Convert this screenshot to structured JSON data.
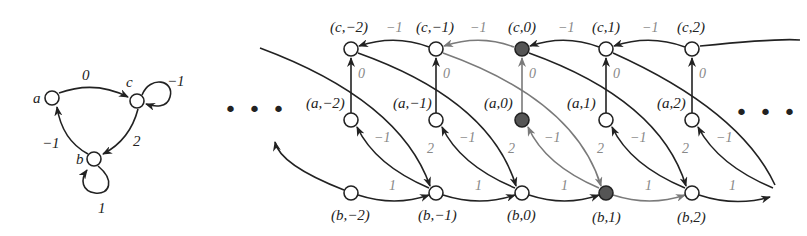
{
  "colors": {
    "edge_dark": "#222222",
    "edge_gray": "#7a7a7a",
    "node_fill_highlight": "#555555",
    "node_fill": "#ffffff",
    "text": "#222222",
    "gray_text": "#888888"
  },
  "small_graph": {
    "nodes": [
      {
        "id": "a",
        "label": "a",
        "x": 52,
        "y": 98
      },
      {
        "id": "c",
        "label": "c",
        "x": 137,
        "y": 101
      },
      {
        "id": "b",
        "label": "b",
        "x": 94,
        "y": 159
      }
    ],
    "edges": [
      {
        "from": "a",
        "to": "c",
        "weight": "0"
      },
      {
        "from": "c",
        "to": "c",
        "weight": "−1"
      },
      {
        "from": "c",
        "to": "b",
        "weight": "2"
      },
      {
        "from": "b",
        "to": "a",
        "weight": "−1"
      },
      {
        "from": "b",
        "to": "b",
        "weight": "1"
      }
    ]
  },
  "ellipsis": {
    "left": "• • •",
    "right": "• • •"
  },
  "grid_graph": {
    "columns": [
      -2,
      -1,
      0,
      1,
      2
    ],
    "nodes": {
      "c": [
        "(c,−2)",
        "(c,−1)",
        "(c,0)",
        "(c,1)",
        "(c,2)"
      ],
      "a": [
        "(a,−2)",
        "(a,−1)",
        "(a,0)",
        "(a,1)",
        "(a,2)"
      ],
      "b": [
        "(b,−2)",
        "(b,−1)",
        "(b,0)",
        "(b,1)",
        "(b,2)"
      ]
    },
    "highlighted": [
      "(c,0)",
      "(a,0)",
      "(b,1)"
    ],
    "edge_weights": {
      "c_to_c": "−1",
      "a_to_c": "0",
      "c_to_b": "2",
      "b_to_a": "−1",
      "b_to_b": "1"
    }
  }
}
